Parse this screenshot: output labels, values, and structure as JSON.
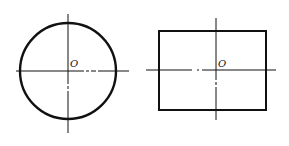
{
  "figures": [
    {
      "shape": "circle",
      "center_label": "O",
      "center": [
        68,
        71
      ],
      "radius": 48,
      "axes": {
        "horizontal": {
          "x1": 16,
          "x2": 129,
          "y": 71
        },
        "vertical": {
          "x": 68,
          "y1": 14,
          "y2": 133
        }
      }
    },
    {
      "shape": "rectangle",
      "center_label": "O",
      "center": [
        216,
        70
      ],
      "rect": {
        "x": 159,
        "y": 31,
        "width": 107,
        "height": 79
      },
      "axes": {
        "horizontal": {
          "x1": 146,
          "x2": 276,
          "y": 70
        },
        "vertical": {
          "x": 216,
          "y1": 18,
          "y2": 120
        }
      }
    }
  ],
  "colors": {
    "stroke": "#111111",
    "background": "#ffffff"
  }
}
